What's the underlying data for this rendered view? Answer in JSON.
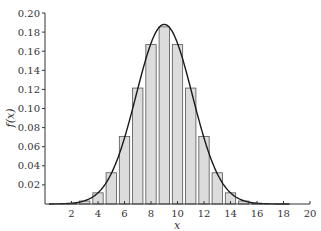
{
  "chart_data": {
    "type": "bar",
    "title": "",
    "xlabel": "x",
    "ylabel": "f(x)",
    "xlim": [
      0,
      20
    ],
    "ylim": [
      0,
      0.2
    ],
    "x_ticks": [
      2,
      4,
      6,
      8,
      10,
      12,
      14,
      16,
      18,
      20
    ],
    "y_ticks": [
      0.02,
      0.04,
      0.06,
      0.08,
      0.1,
      0.12,
      0.14,
      0.16,
      0.18,
      0.2
    ],
    "x_tick_labels": [
      "2",
      "4",
      "6",
      "8",
      "10",
      "12",
      "14",
      "16",
      "18",
      "20"
    ],
    "y_tick_labels": [
      "0.02",
      "0.04",
      "0.06",
      "0.08",
      "0.10",
      "0.12",
      "0.14",
      "0.16",
      "0.18",
      "0.20"
    ],
    "grid": false,
    "legend": null,
    "series": [
      {
        "name": "binomial pmf (bars)",
        "type": "bar",
        "x": [
          2,
          3,
          4,
          5,
          6,
          7,
          8,
          9,
          10,
          11,
          12,
          13,
          14,
          15,
          16
        ],
        "values": [
          0.0006,
          0.0031,
          0.0117,
          0.0327,
          0.0708,
          0.1214,
          0.1669,
          0.1855,
          0.1669,
          0.1214,
          0.0708,
          0.0327,
          0.0117,
          0.0031,
          0.0006
        ]
      },
      {
        "name": "normal approximation (curve)",
        "type": "line",
        "mean": 9,
        "sd": 2.1213
      }
    ],
    "colors": {
      "bar_fill": "#dcdcdc",
      "bar_edge": "#555555",
      "curve": "#1a1a1a",
      "axis": "#333333"
    }
  }
}
